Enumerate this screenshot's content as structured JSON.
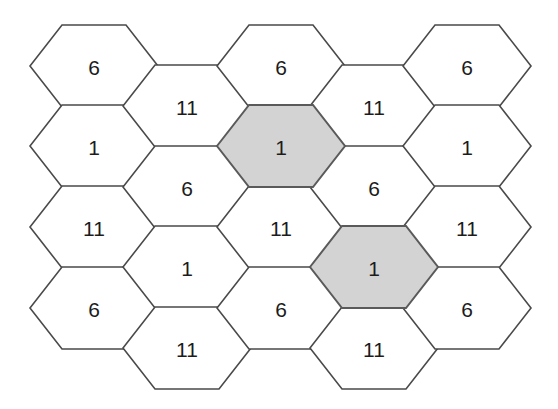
{
  "figure": {
    "kind": "hexagonal-cell-grid",
    "width": 558,
    "height": 409,
    "background_color": "#ffffff",
    "cell_stroke_color": "#4a4a4a",
    "shaded_cell_stroke_color": "#5a5a5a",
    "shaded_fill_color": "#d3d3d3",
    "plain_fill_color": "#ffffff",
    "label_color": "#1c1c1c"
  },
  "geometry": {
    "hex_half_width": 64,
    "hex_half_height": 41,
    "hex_side_half_width": 32,
    "column_step": 93,
    "row_step": 81,
    "column_vertical_offset": 40
  },
  "chart_data": {
    "type": "table",
    "title": "",
    "xlabel": "",
    "ylabel": "",
    "legend": [
      {
        "key": "shaded",
        "label": "1",
        "color": "#d3d3d3"
      },
      {
        "key": "plain",
        "label": "",
        "color": "#ffffff"
      }
    ],
    "categories": [
      "1",
      "6",
      "11"
    ],
    "values": [
      6,
      7,
      6
    ],
    "cells": [
      {
        "id": "c1",
        "label": "6",
        "cx": 94,
        "cy": 66,
        "shaded": false,
        "col": 0,
        "row": 0
      },
      {
        "id": "c2",
        "label": "1",
        "cx": 94,
        "cy": 146,
        "shaded": false,
        "col": 0,
        "row": 1
      },
      {
        "id": "c3",
        "label": "11",
        "cx": 94,
        "cy": 227,
        "shaded": false,
        "col": 0,
        "row": 2
      },
      {
        "id": "c4",
        "label": "6",
        "cx": 94,
        "cy": 308,
        "shaded": false,
        "col": 0,
        "row": 3
      },
      {
        "id": "c5",
        "label": "11",
        "cx": 187,
        "cy": 106,
        "shaded": false,
        "col": 1,
        "row": 0
      },
      {
        "id": "c6",
        "label": "6",
        "cx": 187,
        "cy": 187,
        "shaded": false,
        "col": 1,
        "row": 1
      },
      {
        "id": "c7",
        "label": "1",
        "cx": 187,
        "cy": 267,
        "shaded": false,
        "col": 1,
        "row": 2
      },
      {
        "id": "c8",
        "label": "11",
        "cx": 187,
        "cy": 348,
        "shaded": false,
        "col": 1,
        "row": 3
      },
      {
        "id": "c9",
        "label": "6",
        "cx": 281,
        "cy": 66,
        "shaded": false,
        "col": 2,
        "row": 0
      },
      {
        "id": "c10",
        "label": "1",
        "cx": 281,
        "cy": 146,
        "shaded": true,
        "col": 2,
        "row": 1
      },
      {
        "id": "c11",
        "label": "11",
        "cx": 281,
        "cy": 227,
        "shaded": false,
        "col": 2,
        "row": 2
      },
      {
        "id": "c12",
        "label": "6",
        "cx": 281,
        "cy": 308,
        "shaded": false,
        "col": 2,
        "row": 3
      },
      {
        "id": "c13",
        "label": "11",
        "cx": 374,
        "cy": 106,
        "shaded": false,
        "col": 3,
        "row": 0
      },
      {
        "id": "c14",
        "label": "6",
        "cx": 374,
        "cy": 187,
        "shaded": false,
        "col": 3,
        "row": 1
      },
      {
        "id": "c15",
        "label": "1",
        "cx": 374,
        "cy": 267,
        "shaded": true,
        "col": 3,
        "row": 2
      },
      {
        "id": "c16",
        "label": "11",
        "cx": 374,
        "cy": 348,
        "shaded": false,
        "col": 3,
        "row": 3
      },
      {
        "id": "c17",
        "label": "6",
        "cx": 467,
        "cy": 66,
        "shaded": false,
        "col": 4,
        "row": 0
      },
      {
        "id": "c18",
        "label": "1",
        "cx": 467,
        "cy": 146,
        "shaded": false,
        "col": 4,
        "row": 1
      },
      {
        "id": "c19",
        "label": "11",
        "cx": 467,
        "cy": 227,
        "shaded": false,
        "col": 4,
        "row": 2
      },
      {
        "id": "c20",
        "label": "6",
        "cx": 467,
        "cy": 308,
        "shaded": false,
        "col": 4,
        "row": 3
      }
    ]
  }
}
